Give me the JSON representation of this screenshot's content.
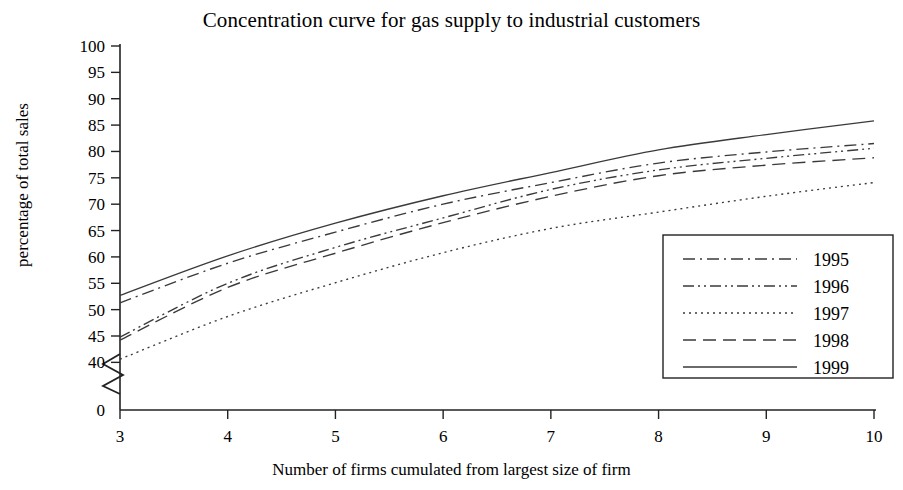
{
  "chart_data": {
    "type": "line",
    "title": "Concentration curve for gas supply to industrial customers",
    "xlabel": "Number of firms cumulated from largest size of firm",
    "ylabel": "percentage of total sales",
    "x": [
      3,
      4,
      5,
      6,
      7,
      8,
      9,
      10
    ],
    "xlim": [
      3,
      10
    ],
    "xticks": [
      3,
      4,
      5,
      6,
      7,
      8,
      9,
      10
    ],
    "xtick_labels": [
      "3",
      "4",
      "5",
      "6",
      "7",
      "8",
      "9",
      "10"
    ],
    "ylim": [
      40,
      100
    ],
    "yticks": [
      40,
      45,
      50,
      55,
      60,
      65,
      70,
      75,
      80,
      85,
      90,
      95,
      100
    ],
    "ytick_labels": [
      "40",
      "45",
      "50",
      "55",
      "60",
      "65",
      "70",
      "75",
      "80",
      "85",
      "90",
      "95",
      "100"
    ],
    "y_origin_label": "0",
    "axis_break": true,
    "grid": false,
    "legend_position": "lower right",
    "series": [
      {
        "name": "1995",
        "style": "dashdot",
        "color": "#3a3a3a",
        "values": [
          51.3,
          58.8,
          64.7,
          70.0,
          74.1,
          77.8,
          79.9,
          81.5
        ]
      },
      {
        "name": "1996",
        "style": "dashdotdot",
        "color": "#3a3a3a",
        "values": [
          44.8,
          55.0,
          61.8,
          67.4,
          72.8,
          76.5,
          78.7,
          80.6
        ]
      },
      {
        "name": "1997",
        "style": "dotted",
        "color": "#3a3a3a",
        "values": [
          40.6,
          48.7,
          55.1,
          60.8,
          65.4,
          68.5,
          71.5,
          74.1
        ]
      },
      {
        "name": "1998",
        "style": "dashed",
        "color": "#3a3a3a",
        "values": [
          44.2,
          54.2,
          60.7,
          66.5,
          71.5,
          75.4,
          77.4,
          78.8
        ]
      },
      {
        "name": "1999",
        "style": "solid",
        "color": "#3a3a3a",
        "values": [
          52.7,
          60.2,
          66.4,
          71.6,
          76.0,
          80.3,
          83.2,
          85.8
        ]
      }
    ]
  }
}
